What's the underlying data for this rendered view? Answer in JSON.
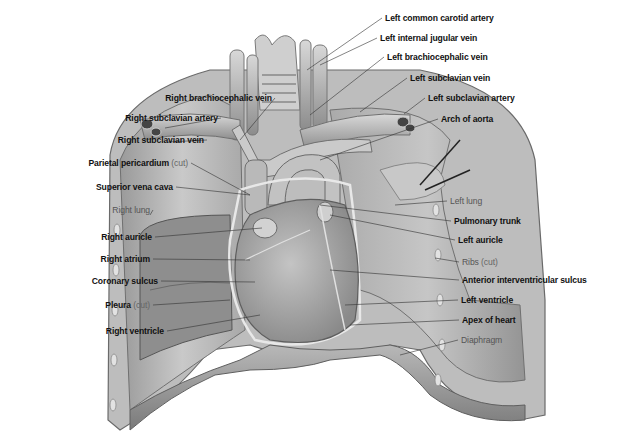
{
  "diagram": {
    "colors": {
      "background": "#ffffff",
      "label_bold": "#111111",
      "label_light": "#555555",
      "leader_line": "#333333",
      "tissue_light": "#d9d9d9",
      "tissue_mid": "#b0b0b0",
      "tissue_dark": "#6e6e6e"
    },
    "labels_left": [
      {
        "id": "right-brachiocephalic-vein",
        "text": "Right brachiocephalic vein",
        "suffix": "",
        "style": "bold"
      },
      {
        "id": "right-subclavian-artery",
        "text": "Right subclavian artery",
        "suffix": "",
        "style": "bold"
      },
      {
        "id": "right-subclavian-vein",
        "text": "Right subclavian vein",
        "suffix": "",
        "style": "bold"
      },
      {
        "id": "parietal-pericardium",
        "text": "Parietal pericardium",
        "suffix": "(cut)",
        "style": "bold"
      },
      {
        "id": "superior-vena-cava",
        "text": "Superior vena cava",
        "suffix": "",
        "style": "bold"
      },
      {
        "id": "right-lung",
        "text": "Right lung",
        "suffix": "",
        "style": "light"
      },
      {
        "id": "right-auricle",
        "text": "Right auricle",
        "suffix": "",
        "style": "bold"
      },
      {
        "id": "right-atrium",
        "text": "Right atrium",
        "suffix": "",
        "style": "bold"
      },
      {
        "id": "coronary-sulcus",
        "text": "Coronary sulcus",
        "suffix": "",
        "style": "bold"
      },
      {
        "id": "pleura",
        "text": "Pleura",
        "suffix": "(cut)",
        "style": "bold"
      },
      {
        "id": "right-ventricle",
        "text": "Right ventricle",
        "suffix": "",
        "style": "bold"
      }
    ],
    "labels_right": [
      {
        "id": "left-common-carotid-artery",
        "text": "Left common carotid artery",
        "suffix": "",
        "style": "bold"
      },
      {
        "id": "left-internal-jugular-vein",
        "text": "Left internal jugular vein",
        "suffix": "",
        "style": "bold"
      },
      {
        "id": "left-brachiocephalic-vein",
        "text": "Left brachiocephalic vein",
        "suffix": "",
        "style": "bold"
      },
      {
        "id": "left-subclavian-vein",
        "text": "Left subclavian vein",
        "suffix": "",
        "style": "bold"
      },
      {
        "id": "left-subclavian-artery",
        "text": "Left subclavian artery",
        "suffix": "",
        "style": "bold"
      },
      {
        "id": "arch-of-aorta",
        "text": "Arch of aorta",
        "suffix": "",
        "style": "bold"
      },
      {
        "id": "left-lung",
        "text": "Left lung",
        "suffix": "",
        "style": "light"
      },
      {
        "id": "pulmonary-trunk",
        "text": "Pulmonary trunk",
        "suffix": "",
        "style": "bold"
      },
      {
        "id": "left-auricle",
        "text": "Left auricle",
        "suffix": "",
        "style": "bold"
      },
      {
        "id": "ribs",
        "text": "Ribs",
        "suffix": "(cut)",
        "style": "light"
      },
      {
        "id": "anterior-interventricular-sulcus",
        "text": "Anterior interventricular sulcus",
        "suffix": "",
        "style": "bold"
      },
      {
        "id": "left-ventricle",
        "text": "Left ventricle",
        "suffix": "",
        "style": "bold"
      },
      {
        "id": "apex-of-heart",
        "text": "Apex of heart",
        "suffix": "",
        "style": "bold"
      },
      {
        "id": "diaphragm",
        "text": "Diaphragm",
        "suffix": "",
        "style": "light"
      }
    ]
  }
}
